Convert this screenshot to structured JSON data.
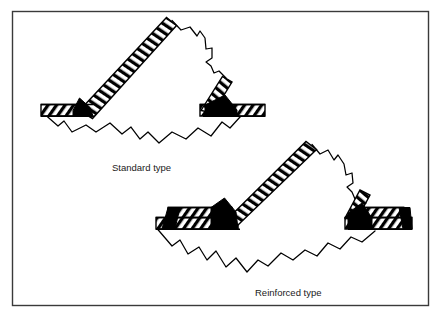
{
  "figure": {
    "background_color": "#ffffff",
    "line_color": "#000000",
    "fill_weld_color": "#000000",
    "border": {
      "name": "figure-border",
      "x": 12,
      "y": 11,
      "width": 417,
      "height": 295,
      "stroke_width": 1.4,
      "color": "#333333"
    }
  },
  "captions": [
    {
      "id": "standard",
      "label": "Standard type",
      "x": 112,
      "y": 171
    },
    {
      "id": "reinforced",
      "label": "Reinforced type",
      "x": 255,
      "y": 296
    }
  ],
  "diagrams": [
    {
      "id": "standard-type",
      "name": "standard-type-joint",
      "caption": "Standard type",
      "description": "Single hatched flange plate with diagonal hatched brace and black triangular weld fillets at both ends; jagged fracture outline below.",
      "flange_layers": 1,
      "weld_fillets": 2,
      "brace_angle_deg": 44,
      "hatch_style": "diagonal-bar"
    },
    {
      "id": "reinforced-type",
      "name": "reinforced-type-joint",
      "caption": "Reinforced type",
      "description": "Double-layer hatched flange plate (reinforcing cover plate) with diagonal hatched brace and larger black weld fillets; jagged fracture outline below.",
      "flange_layers": 2,
      "weld_fillets": 2,
      "brace_angle_deg": 44,
      "hatch_style": "diagonal-bar"
    }
  ],
  "legend_notes": {
    "hatched_band": "steel member section",
    "black_wedge": "weld metal / fillet weld",
    "jagged_line": "fracture surface"
  }
}
